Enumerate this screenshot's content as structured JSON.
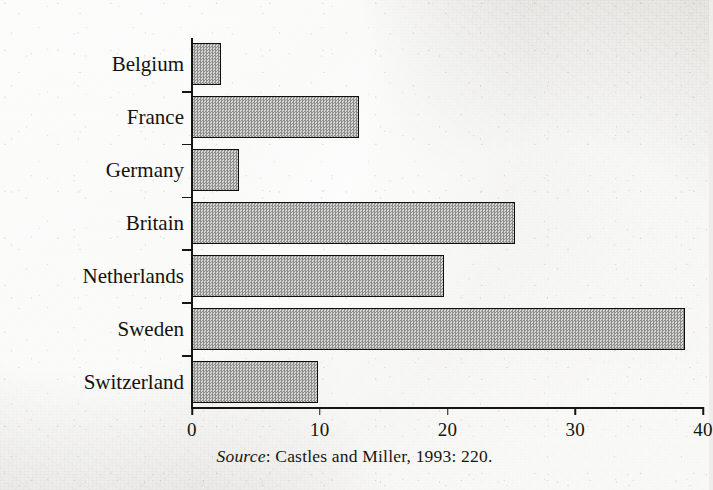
{
  "chart_data": {
    "type": "bar",
    "orientation": "horizontal",
    "title": "",
    "subtitle": "",
    "xlabel": "",
    "ylabel": "",
    "categories": [
      "Belgium",
      "France",
      "Germany",
      "Britain",
      "Netherlands",
      "Sweden",
      "Switzerland"
    ],
    "values": [
      2.3,
      13.1,
      3.7,
      25.3,
      19.7,
      38.6,
      9.9
    ],
    "xlim": [
      0,
      40
    ],
    "xticks": [
      0,
      10,
      20,
      30,
      40
    ],
    "xtick_labels": [
      "0",
      "10",
      "20",
      "30",
      "40"
    ],
    "grid": false,
    "legend": false,
    "series": [
      {
        "name": "",
        "values": [
          2.3,
          13.1,
          3.7,
          25.3,
          19.7,
          38.6,
          9.9
        ]
      }
    ],
    "bar_fill": "#b9b9b7",
    "bar_outline": "#111008",
    "background_color": "#edece8",
    "text_color": "#14130d"
  },
  "source_note": {
    "label": "Source",
    "separator": ": ",
    "text": "Castles and Miller, 1993: 220.",
    "full": "Source: Castles and Miller, 1993: 220."
  }
}
